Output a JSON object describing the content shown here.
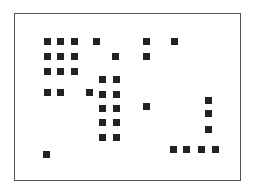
{
  "diagram": {
    "type": "dot-grid",
    "frame": {
      "x": 14,
      "y": 13,
      "width": 227,
      "height": 168,
      "border_color": "#555555"
    },
    "square_size": 7,
    "square_color": "#222222",
    "squares": [
      {
        "x": 44,
        "y": 38
      },
      {
        "x": 57,
        "y": 38
      },
      {
        "x": 71,
        "y": 38
      },
      {
        "x": 93,
        "y": 38
      },
      {
        "x": 143,
        "y": 38
      },
      {
        "x": 171,
        "y": 38
      },
      {
        "x": 44,
        "y": 53
      },
      {
        "x": 57,
        "y": 53
      },
      {
        "x": 71,
        "y": 53
      },
      {
        "x": 112,
        "y": 53
      },
      {
        "x": 143,
        "y": 53
      },
      {
        "x": 44,
        "y": 68
      },
      {
        "x": 57,
        "y": 68
      },
      {
        "x": 71,
        "y": 68
      },
      {
        "x": 99,
        "y": 76
      },
      {
        "x": 113,
        "y": 76
      },
      {
        "x": 44,
        "y": 89
      },
      {
        "x": 57,
        "y": 89
      },
      {
        "x": 86,
        "y": 89
      },
      {
        "x": 99,
        "y": 91
      },
      {
        "x": 113,
        "y": 91
      },
      {
        "x": 205,
        "y": 97
      },
      {
        "x": 99,
        "y": 105
      },
      {
        "x": 113,
        "y": 105
      },
      {
        "x": 143,
        "y": 103
      },
      {
        "x": 205,
        "y": 110
      },
      {
        "x": 99,
        "y": 119
      },
      {
        "x": 113,
        "y": 119
      },
      {
        "x": 205,
        "y": 126
      },
      {
        "x": 99,
        "y": 134
      },
      {
        "x": 113,
        "y": 134
      },
      {
        "x": 170,
        "y": 146
      },
      {
        "x": 183,
        "y": 146
      },
      {
        "x": 198,
        "y": 146
      },
      {
        "x": 212,
        "y": 146
      },
      {
        "x": 43,
        "y": 151
      }
    ]
  }
}
